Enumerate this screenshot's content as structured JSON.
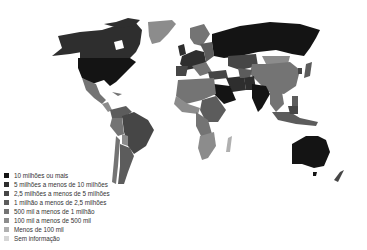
{
  "map": {
    "type": "choropleth",
    "palette": {
      "c1": "#141414",
      "c2": "#2e2e2e",
      "c3": "#464646",
      "c4": "#5c5c5c",
      "c5": "#747474",
      "c6": "#8c8c8c",
      "c7": "#b0b0b0",
      "c8": "#d6d6d6"
    }
  },
  "legend": {
    "items": [
      {
        "label": "10 milhões ou mais",
        "color": "#141414"
      },
      {
        "label": "5 milhões a menos de 10 milhões",
        "color": "#2e2e2e"
      },
      {
        "label": "2,5 milhões a menos de 5 milhões",
        "color": "#464646"
      },
      {
        "label": "1 milhão a menos de 2,5 milhões",
        "color": "#5c5c5c"
      },
      {
        "label": "500 mil a menos de 1 milhão",
        "color": "#747474"
      },
      {
        "label": "100 mil a menos de 500 mil",
        "color": "#8c8c8c"
      },
      {
        "label": "Menos de 100 mil",
        "color": "#b0b0b0"
      },
      {
        "label": "Sem informação",
        "color": "#d6d6d6"
      }
    ]
  }
}
